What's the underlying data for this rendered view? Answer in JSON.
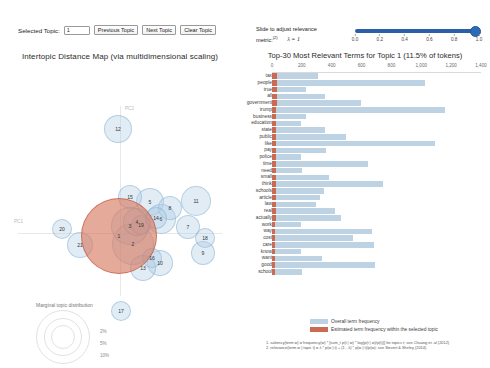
{
  "controls": {
    "selected_topic_label": "Selected Topic:",
    "selected_topic_value": "1",
    "previous_topic": "Previous Topic",
    "next_topic": "Next Topic",
    "clear_topic": "Clear Topic"
  },
  "slider": {
    "line1": "Slide to adjust relevance",
    "line2": "metric:",
    "footnote_ref": "(2)",
    "lambda_text": "λ = 1",
    "value": 1.0,
    "min": 0.0,
    "max": 1.0,
    "ticks": [
      "0.0",
      "0.2",
      "0.4",
      "0.6",
      "0.8",
      "1.0"
    ],
    "accent_color": "#2b5fa8"
  },
  "mds": {
    "title": "Intertopic Distance Map (via multidimensional scaling)",
    "axis_x_label": "PC1",
    "axis_y_label": "PC2",
    "selected_color": "#d6765c",
    "bubble_color": "#afcde4",
    "legend": {
      "title": "Marginal topic distribution",
      "ticks": [
        "2%",
        "5%",
        "10%"
      ]
    },
    "topics": [
      {
        "id": "1",
        "x": 119,
        "y": 192,
        "r": 38,
        "selected": true
      },
      {
        "id": "2",
        "x": 133,
        "y": 200,
        "r": 21,
        "selected": false
      },
      {
        "id": "3",
        "x": 130,
        "y": 182,
        "r": 19,
        "selected": false
      },
      {
        "id": "4",
        "x": 137,
        "y": 178,
        "r": 14,
        "selected": false
      },
      {
        "id": "5",
        "x": 150,
        "y": 158,
        "r": 14,
        "selected": false
      },
      {
        "id": "6",
        "x": 161,
        "y": 175,
        "r": 15,
        "selected": false
      },
      {
        "id": "7",
        "x": 188,
        "y": 183,
        "r": 12,
        "selected": false
      },
      {
        "id": "8",
        "x": 170,
        "y": 164,
        "r": 12,
        "selected": false
      },
      {
        "id": "9",
        "x": 203,
        "y": 209,
        "r": 12,
        "selected": false
      },
      {
        "id": "10",
        "x": 160,
        "y": 219,
        "r": 13,
        "selected": false
      },
      {
        "id": "11",
        "x": 196,
        "y": 157,
        "r": 15,
        "selected": false
      },
      {
        "id": "12",
        "x": 118,
        "y": 85,
        "r": 14,
        "selected": false
      },
      {
        "id": "13",
        "x": 143,
        "y": 224,
        "r": 13,
        "selected": false
      },
      {
        "id": "14",
        "x": 156,
        "y": 174,
        "r": 11,
        "selected": false
      },
      {
        "id": "15",
        "x": 130,
        "y": 153,
        "r": 12,
        "selected": false
      },
      {
        "id": "16",
        "x": 152,
        "y": 214,
        "r": 10,
        "selected": false
      },
      {
        "id": "17",
        "x": 121,
        "y": 267,
        "r": 10,
        "selected": false
      },
      {
        "id": "18",
        "x": 205,
        "y": 194,
        "r": 10,
        "selected": false
      },
      {
        "id": "19",
        "x": 141,
        "y": 181,
        "r": 10,
        "selected": false
      },
      {
        "id": "20",
        "x": 62,
        "y": 185,
        "r": 10,
        "selected": false
      },
      {
        "id": "21",
        "x": 80,
        "y": 201,
        "r": 13,
        "selected": false
      }
    ]
  },
  "chart_data": {
    "type": "bar",
    "title": "Top-30 Most Relevant Terms for Topic 1 (11.5% of tokens)",
    "xlabel": "",
    "ylabel": "",
    "xlim": [
      0,
      1400
    ],
    "xticks": [
      0,
      200,
      400,
      600,
      800,
      1000,
      1200,
      1400
    ],
    "xtick_labels": [
      "0",
      "200",
      "400",
      "600",
      "800",
      "1,000",
      "1,200",
      "1,400"
    ],
    "grid": false,
    "orientation": "horizontal",
    "legend_position": "bottom",
    "categories": [
      "tax",
      "people",
      "true",
      "all",
      "government",
      "trump",
      "business",
      "education",
      "state",
      "public",
      "like",
      "pay",
      "police",
      "time",
      "need",
      "small",
      "think",
      "schools",
      "article",
      "law",
      "real",
      "actually",
      "work",
      "way",
      "cost",
      "care",
      "know",
      "want",
      "good",
      "school"
    ],
    "series": [
      {
        "name": "Overall term frequency",
        "color": "#bdd2e3",
        "values": [
          306,
          1024,
          228,
          355,
          593,
          1160,
          230,
          195,
          352,
          495,
          1090,
          360,
          195,
          645,
          200,
          382,
          746,
          350,
          321,
          296,
          420,
          465,
          195,
          672,
          544,
          680,
          195,
          332,
          692,
          198
        ]
      },
      {
        "name": "Estimated term frequency within the selected topic",
        "color": "#cb6a52",
        "values": [
          34,
          32,
          32,
          31,
          31,
          30,
          30,
          29,
          29,
          28,
          28,
          27,
          27,
          26,
          26,
          26,
          25,
          25,
          25,
          24,
          24,
          24,
          23,
          23,
          23,
          22,
          22,
          22,
          21,
          21
        ]
      }
    ],
    "legend": [
      {
        "label": "Overall term frequency",
        "color": "#bdd2e3"
      },
      {
        "label": "Estimated term frequency within the selected topic",
        "color": "#cb6a52"
      }
    ],
    "footnotes": [
      "1. saliency(term w) = frequency(w) * [sum_t p(t | w) * log(p(t | w)/p(t))] for topics t; see Chuang et. al (2012)",
      "2. relevance(term w | topic t) = λ * p(w | t) + (1 - λ) * p(w | t)/p(w); see Sievert & Shirley (2014)"
    ]
  }
}
